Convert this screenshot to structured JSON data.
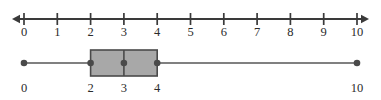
{
  "figure": {
    "kind": "box-plot-on-number-line",
    "width": 381,
    "height": 100,
    "background_color": "#ffffff"
  },
  "number_line": {
    "name": "horizontal-number-line",
    "min": 0,
    "max": 10,
    "step": 1,
    "left_arrow": true,
    "right_arrow": true,
    "line_color": "#3a3a3a",
    "tick_labels": [
      "0",
      "1",
      "2",
      "3",
      "4",
      "5",
      "6",
      "7",
      "8",
      "9",
      "10"
    ],
    "tick_values": [
      0,
      1,
      2,
      3,
      4,
      5,
      6,
      7,
      8,
      9,
      10
    ]
  },
  "box_plot": {
    "name": "five-number-summary-box-plot",
    "orientation": "horizontal",
    "box_fill_color": "#a8a8a8",
    "box_stroke_color": "#4a4a4a",
    "whisker_color": "#565656",
    "marker_color": "#4a4a4a",
    "minimum": 0,
    "first_quartile": 2,
    "median": 3,
    "third_quartile": 4,
    "maximum": 10,
    "labels": [
      "0",
      "2",
      "3",
      "4",
      "10"
    ],
    "label_values": [
      0,
      2,
      3,
      4,
      10
    ]
  },
  "chart_data": {
    "type": "box",
    "title": "",
    "xlabel": "",
    "ylabel": "",
    "xlim": [
      0,
      10
    ],
    "grid": false,
    "legend": false,
    "categories": [
      "Data"
    ],
    "series": [
      {
        "name": "Data",
        "min": 0,
        "q1": 2,
        "median": 3,
        "q3": 4,
        "max": 10,
        "iqr": 2,
        "range": 10,
        "outliers": []
      }
    ],
    "axis": {
      "ticks": [
        0,
        1,
        2,
        3,
        4,
        5,
        6,
        7,
        8,
        9,
        10
      ],
      "tick_labels": [
        "0",
        "1",
        "2",
        "3",
        "4",
        "5",
        "6",
        "7",
        "8",
        "9",
        "10"
      ],
      "arrows_both_ends": true
    },
    "annotated_values": [
      0,
      2,
      3,
      4,
      10
    ]
  }
}
